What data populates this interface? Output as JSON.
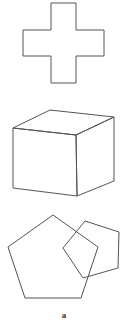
{
  "figure": {
    "panel_label": "a",
    "stroke_color": "#555555",
    "background": "#ffffff",
    "shapes": [
      {
        "name": "cross",
        "points": "51,3 76,3 76,30 104,30 104,56 76,56 76,83 51,83 51,56 23,56 23,30 51,30"
      },
      {
        "name": "cube",
        "faces": {
          "top": "13,128 50,110 114,117 76,135",
          "front": "13,128 76,135 77,196 13,188",
          "side": "76,135 114,117 114,181 77,196"
        }
      },
      {
        "name": "large-pentagon",
        "points": "53,215 98,247 81,298 25,298 8,247"
      },
      {
        "name": "small-pentagon",
        "points": "85,221 119,232 118,268 83,278 63,248"
      }
    ]
  }
}
